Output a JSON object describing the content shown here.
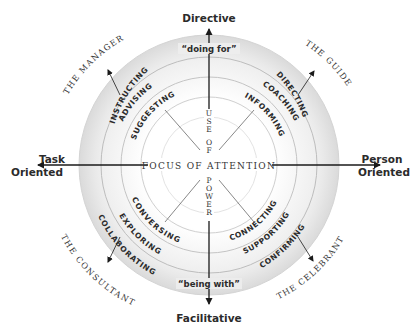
{
  "diagram": {
    "axes": {
      "top": "Directive",
      "bottom": "Facilitative",
      "left_line1": "Task",
      "left_line2": "Oriented",
      "right_line1": "Person",
      "right_line2": "Oriented"
    },
    "outer_band": {
      "top_label": "“doing for”",
      "bottom_label": "“being with”"
    },
    "center": {
      "horizontal": "Focus of Attention",
      "vertical_top_letters": [
        "U",
        "S",
        "E",
        "",
        "O",
        "F"
      ],
      "vertical_bottom_letters": [
        "P",
        "O",
        "W",
        "E",
        "R"
      ]
    },
    "quadrants": {
      "top_left": {
        "role": "The Manager",
        "outer": "INSTRUCTING",
        "middle": "ADVISING",
        "inner": "SUGGESTING"
      },
      "top_right": {
        "role": "The Guide",
        "outer": "DIRECTING",
        "middle": "COACHING",
        "inner": "INFORMING"
      },
      "bottom_left": {
        "role": "The Consultant",
        "outer": "COLLABORATING",
        "middle": "EXPLORING",
        "inner": "CONVERSING"
      },
      "bottom_right": {
        "role": "The Celebrant",
        "outer": "CONFIRMING",
        "middle": "SUPPORTING",
        "inner": "CONNECTING"
      }
    },
    "colors": {
      "band_outer": "#d9d9d9",
      "band_inner": "#f2f2f2",
      "ring_line": "#c8c8c8",
      "axis": "#1a1a1a",
      "text": "#2b2b2b"
    }
  }
}
